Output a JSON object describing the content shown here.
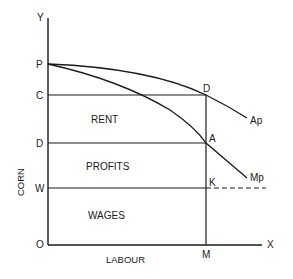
{
  "diagram": {
    "axes": {
      "y_axis_label": "Y",
      "x_axis_label": "X",
      "origin_label": "O",
      "y_title": "CORN",
      "x_title": "LABOUR"
    },
    "y_points": {
      "p": "P",
      "c": "C",
      "d": "D",
      "w": "W"
    },
    "x_points": {
      "m": "M"
    },
    "intersections": {
      "d_top": "D",
      "a": "A",
      "k": "K"
    },
    "curves": {
      "average_product": "Ap",
      "marginal_product": "Mp"
    },
    "regions": {
      "rent": "RENT",
      "profits": "PROFITS",
      "wages": "WAGES"
    },
    "colors": {
      "line": "#1a1a1a",
      "background": "#ffffff"
    }
  }
}
